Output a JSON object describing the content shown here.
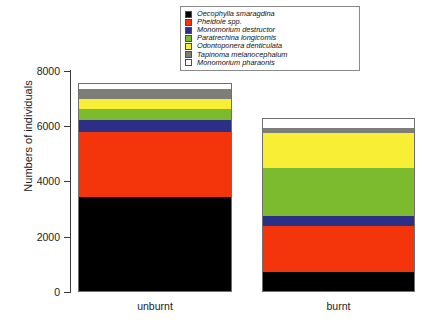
{
  "chart_data": {
    "type": "bar",
    "subtype": "stacked",
    "title": "",
    "xlabel": "",
    "ylabel": "Numbers of individuals",
    "ylim": [
      0,
      8000
    ],
    "yticks": [
      0,
      2000,
      4000,
      6000,
      8000
    ],
    "ytick_labels": [
      "0",
      "2000",
      "4000",
      "6000",
      "8000"
    ],
    "grid": false,
    "legend_position": "top-center",
    "categories": [
      "unburnt",
      "burnt"
    ],
    "series": [
      {
        "name": "Oecophylla smaragdina",
        "color": "#000000",
        "values": [
          3430,
          720
        ]
      },
      {
        "name": "Pheidole spp.",
        "color": "#F4340A",
        "values": [
          2350,
          1660
        ]
      },
      {
        "name": "Monomorium destructor",
        "color": "#2B2F86",
        "values": [
          430,
          360
        ]
      },
      {
        "name": "Paratrechina longicornis",
        "color": "#7DBB2E",
        "values": [
          400,
          1735
        ]
      },
      {
        "name": "Odontoponera denticulata",
        "color": "#F7EE35",
        "values": [
          360,
          1265
        ]
      },
      {
        "name": "Tapinoma melanocephalum",
        "color": "#7E7E78",
        "values": [
          360,
          180
        ]
      },
      {
        "name": "Monomorium pharaonis",
        "color": "#FFFFFF",
        "values": [
          215,
          360
        ]
      }
    ],
    "totals": [
      7545,
      6280
    ]
  },
  "legend": {
    "items": [
      "Oecophylla smaragdina",
      "Pheidole spp.",
      "Monomorium destructor",
      "Paratrechina longicornis",
      "Odontoponera denticulata",
      "Tapinoma melanocephalum",
      "Monomorium pharaonis"
    ]
  }
}
